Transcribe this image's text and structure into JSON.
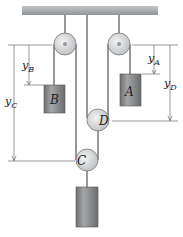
{
  "diagram": {
    "type": "pulley-system",
    "labels": {
      "block_a": "A",
      "block_b": "B",
      "pulley_c": "C",
      "pulley_d": "D",
      "y_a": "y",
      "y_a_sub": "A",
      "y_b": "y",
      "y_b_sub": "B",
      "y_c": "y",
      "y_c_sub": "C",
      "y_d": "y",
      "y_d_sub": "D"
    },
    "colors": {
      "ceiling": "#a9adb0",
      "block": "#8a8c8e",
      "pulley": "#d6d8da",
      "rope": "#333333",
      "dimension": "#444444"
    }
  }
}
